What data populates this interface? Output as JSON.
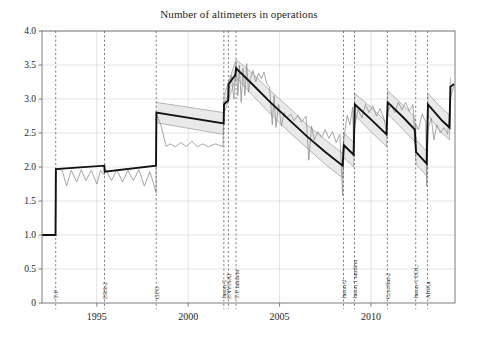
{
  "chart_data": {
    "type": "line",
    "title": "Number of altimeters in operations",
    "xlabel": "",
    "ylabel": "",
    "xlim": [
      1992.0,
      2014.6
    ],
    "ylim": [
      0,
      4.0
    ],
    "grid": true,
    "legend": "none",
    "yticks": [
      "0",
      "0.5",
      "1.0",
      "1.5",
      "2.0",
      "2.5",
      "3.0",
      "3.5",
      "4.0"
    ],
    "ytick_values": [
      0,
      0.5,
      1.0,
      1.5,
      2.0,
      2.5,
      3.0,
      3.5,
      4.0
    ],
    "xticks": [
      "1995",
      "2000",
      "2005",
      "2010"
    ],
    "xtick_values": [
      1995,
      2000,
      2005,
      2010
    ],
    "annotations": [
      {
        "label": "T/P",
        "x": 1992.75
      },
      {
        "label": "ERS-2",
        "x": 1995.42
      },
      {
        "label": "GFO",
        "x": 1998.25
      },
      {
        "label": "Jason-1",
        "x": 2001.95
      },
      {
        "label": "ENVISAT",
        "x": 2002.2
      },
      {
        "label": "T/P tandem",
        "x": 2002.62
      },
      {
        "label": "Jason-2",
        "x": 2008.5
      },
      {
        "label": "Jason 1 tandem",
        "x": 2009.1
      },
      {
        "label": "CryoSat-2",
        "x": 2010.9
      },
      {
        "label": "Jason-1 EOL",
        "x": 2012.45
      },
      {
        "label": "AltiKa",
        "x": 2013.1
      }
    ],
    "series": [
      {
        "name": "mean-number-of-altimeters",
        "style": "thick-black-step",
        "color": "#111111",
        "points": [
          [
            1992.0,
            1.0
          ],
          [
            1992.74,
            1.0
          ],
          [
            1992.76,
            1.97
          ],
          [
            1995.41,
            2.02
          ],
          [
            1995.43,
            1.93
          ],
          [
            1998.24,
            2.02
          ],
          [
            1998.26,
            2.8
          ],
          [
            2001.94,
            2.64
          ],
          [
            2001.96,
            2.92
          ],
          [
            2002.19,
            2.98
          ],
          [
            2002.21,
            3.22
          ],
          [
            2002.58,
            3.35
          ],
          [
            2002.62,
            3.45
          ],
          [
            2003.5,
            3.22
          ],
          [
            2004.5,
            2.95
          ],
          [
            2005.5,
            2.7
          ],
          [
            2006.5,
            2.45
          ],
          [
            2007.5,
            2.22
          ],
          [
            2008.45,
            2.02
          ],
          [
            2008.52,
            2.32
          ],
          [
            2009.05,
            2.18
          ],
          [
            2009.12,
            2.92
          ],
          [
            2010.0,
            2.7
          ],
          [
            2010.85,
            2.48
          ],
          [
            2010.92,
            2.95
          ],
          [
            2011.8,
            2.72
          ],
          [
            2012.4,
            2.55
          ],
          [
            2012.47,
            2.22
          ],
          [
            2013.05,
            2.05
          ],
          [
            2013.12,
            2.92
          ],
          [
            2013.9,
            2.68
          ],
          [
            2014.3,
            2.58
          ],
          [
            2014.35,
            3.18
          ],
          [
            2014.55,
            3.22
          ]
        ]
      },
      {
        "name": "instantaneous-number-of-altimeters",
        "style": "thin-gray-noisy",
        "color": "#8a8a8a",
        "points": [
          [
            1992.0,
            1.0
          ],
          [
            1992.74,
            1.0
          ],
          [
            1992.76,
            1.98
          ],
          [
            1993.1,
            1.95
          ],
          [
            1993.35,
            1.72
          ],
          [
            1993.6,
            1.95
          ],
          [
            1993.9,
            1.78
          ],
          [
            1994.15,
            1.96
          ],
          [
            1994.4,
            1.8
          ],
          [
            1994.7,
            1.95
          ],
          [
            1995.0,
            1.75
          ],
          [
            1995.2,
            1.95
          ],
          [
            1995.41,
            1.88
          ],
          [
            1995.45,
            1.98
          ],
          [
            1995.8,
            1.8
          ],
          [
            1996.1,
            1.96
          ],
          [
            1996.4,
            1.78
          ],
          [
            1996.7,
            1.95
          ],
          [
            1997.0,
            1.8
          ],
          [
            1997.3,
            1.96
          ],
          [
            1997.6,
            1.72
          ],
          [
            1997.9,
            1.93
          ],
          [
            1998.1,
            1.76
          ],
          [
            1998.24,
            1.62
          ],
          [
            1998.26,
            2.78
          ],
          [
            1998.5,
            2.62
          ],
          [
            1998.8,
            2.3
          ],
          [
            1999.0,
            2.34
          ],
          [
            1999.3,
            2.3
          ],
          [
            1999.6,
            2.36
          ],
          [
            1999.9,
            2.3
          ],
          [
            2000.2,
            2.38
          ],
          [
            2000.5,
            2.3
          ],
          [
            2000.8,
            2.34
          ],
          [
            2001.1,
            2.3
          ],
          [
            2001.5,
            2.34
          ],
          [
            2001.9,
            2.3
          ],
          [
            2001.96,
            2.95
          ],
          [
            2002.2,
            3.05
          ],
          [
            2002.35,
            3.35
          ],
          [
            2002.5,
            3.0
          ],
          [
            2002.62,
            3.52
          ],
          [
            2002.72,
            3.05
          ],
          [
            2002.8,
            3.5
          ],
          [
            2002.9,
            2.95
          ],
          [
            2003.0,
            3.45
          ],
          [
            2003.1,
            3.05
          ],
          [
            2003.2,
            3.52
          ],
          [
            2003.3,
            3.1
          ],
          [
            2003.4,
            3.3
          ],
          [
            2003.55,
            3.42
          ],
          [
            2003.7,
            3.25
          ],
          [
            2003.85,
            3.38
          ],
          [
            2004.0,
            3.3
          ],
          [
            2004.15,
            3.4
          ],
          [
            2004.3,
            3.22
          ],
          [
            2004.45,
            3.18
          ],
          [
            2004.6,
            2.62
          ],
          [
            2004.7,
            3.05
          ],
          [
            2004.8,
            2.58
          ],
          [
            2004.95,
            2.92
          ],
          [
            2005.1,
            2.6
          ],
          [
            2005.25,
            2.8
          ],
          [
            2005.4,
            2.72
          ],
          [
            2005.6,
            2.78
          ],
          [
            2005.8,
            2.68
          ],
          [
            2006.0,
            2.76
          ],
          [
            2006.2,
            2.66
          ],
          [
            2006.45,
            2.75
          ],
          [
            2006.6,
            2.1
          ],
          [
            2006.75,
            2.6
          ],
          [
            2006.9,
            2.4
          ],
          [
            2007.1,
            2.52
          ],
          [
            2007.3,
            2.44
          ],
          [
            2007.5,
            2.55
          ],
          [
            2007.7,
            2.42
          ],
          [
            2007.9,
            2.52
          ],
          [
            2008.1,
            2.36
          ],
          [
            2008.3,
            2.48
          ],
          [
            2008.45,
            1.58
          ],
          [
            2008.52,
            2.42
          ],
          [
            2008.7,
            2.76
          ],
          [
            2008.85,
            2.62
          ],
          [
            2009.0,
            2.88
          ],
          [
            2009.05,
            2.3
          ],
          [
            2009.12,
            2.62
          ],
          [
            2009.3,
            2.85
          ],
          [
            2009.5,
            2.72
          ],
          [
            2009.7,
            2.92
          ],
          [
            2009.9,
            2.8
          ],
          [
            2010.1,
            2.9
          ],
          [
            2010.3,
            2.75
          ],
          [
            2010.5,
            2.86
          ],
          [
            2010.7,
            2.72
          ],
          [
            2010.85,
            2.55
          ],
          [
            2010.92,
            2.8
          ],
          [
            2011.1,
            2.92
          ],
          [
            2011.3,
            2.8
          ],
          [
            2011.5,
            2.95
          ],
          [
            2011.7,
            2.84
          ],
          [
            2011.9,
            2.95
          ],
          [
            2012.1,
            2.82
          ],
          [
            2012.3,
            2.92
          ],
          [
            2012.4,
            2.35
          ],
          [
            2012.47,
            2.62
          ],
          [
            2012.6,
            2.55
          ],
          [
            2012.8,
            2.78
          ],
          [
            2013.0,
            2.66
          ],
          [
            2013.05,
            1.72
          ],
          [
            2013.12,
            2.55
          ],
          [
            2013.3,
            2.72
          ],
          [
            2013.45,
            2.4
          ],
          [
            2013.6,
            2.62
          ],
          [
            2013.8,
            2.5
          ],
          [
            2014.0,
            2.58
          ],
          [
            2014.2,
            2.48
          ],
          [
            2014.35,
            3.02
          ],
          [
            2014.55,
            3.2
          ]
        ]
      },
      {
        "name": "uncertainty-band-upper",
        "style": "band-edge",
        "color": "#9a9a9a",
        "points": [
          [
            1998.26,
            2.95
          ],
          [
            2001.94,
            2.8
          ],
          [
            2001.96,
            3.05
          ],
          [
            2002.62,
            3.58
          ],
          [
            2003.5,
            3.38
          ],
          [
            2004.5,
            3.12
          ],
          [
            2005.5,
            2.88
          ],
          [
            2006.5,
            2.62
          ],
          [
            2007.5,
            2.4
          ],
          [
            2008.45,
            2.2
          ],
          [
            2008.52,
            2.5
          ],
          [
            2009.05,
            2.36
          ],
          [
            2009.12,
            3.08
          ],
          [
            2010.0,
            2.88
          ],
          [
            2010.85,
            2.66
          ],
          [
            2010.92,
            3.12
          ],
          [
            2011.8,
            2.9
          ],
          [
            2012.4,
            2.73
          ],
          [
            2012.47,
            2.4
          ],
          [
            2013.05,
            2.23
          ],
          [
            2013.12,
            3.08
          ],
          [
            2013.9,
            2.86
          ],
          [
            2014.3,
            2.76
          ],
          [
            2014.35,
            3.32
          ]
        ]
      },
      {
        "name": "uncertainty-band-lower",
        "style": "band-edge",
        "color": "#9a9a9a",
        "points": [
          [
            1998.26,
            2.65
          ],
          [
            2001.94,
            2.48
          ],
          [
            2001.96,
            2.78
          ],
          [
            2002.62,
            3.32
          ],
          [
            2003.5,
            3.06
          ],
          [
            2004.5,
            2.78
          ],
          [
            2005.5,
            2.52
          ],
          [
            2006.5,
            2.28
          ],
          [
            2007.5,
            2.04
          ],
          [
            2008.45,
            1.84
          ],
          [
            2008.52,
            2.14
          ],
          [
            2009.05,
            2.0
          ],
          [
            2009.12,
            2.76
          ],
          [
            2010.0,
            2.52
          ],
          [
            2010.85,
            2.3
          ],
          [
            2010.92,
            2.78
          ],
          [
            2011.8,
            2.54
          ],
          [
            2012.4,
            2.37
          ],
          [
            2012.47,
            2.04
          ],
          [
            2013.05,
            1.87
          ],
          [
            2013.12,
            2.76
          ],
          [
            2013.9,
            2.5
          ],
          [
            2014.3,
            2.4
          ],
          [
            2014.35,
            3.04
          ]
        ]
      }
    ],
    "colors": {
      "band_fill": "#e9e9e9",
      "band_edge": "#9a9a9a",
      "thick_line": "#111111",
      "thin_line": "#8a8a8a",
      "grid": "#d8d8d8",
      "event_line": "#555555",
      "frame": "#6e6e6e",
      "background": "#ffffff"
    }
  }
}
